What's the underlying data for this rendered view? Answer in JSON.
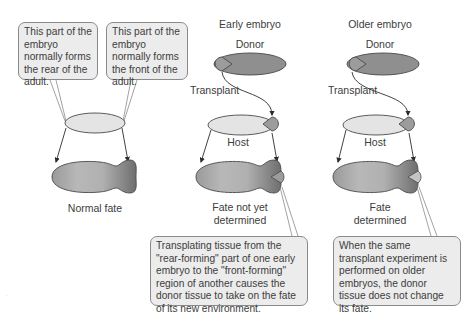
{
  "callouts": {
    "rear": "This part of the embryo normally forms the rear of the adult.",
    "front": "This part of the embryo normally forms the front of the adult.",
    "early_result": "Transplating tissue from the \"rear-forming\" part of one early embryo to the \"front-forming\" region of another causes the donor tissue to take on the fate of its new environment.",
    "older_result": "When the same transplant experiment is performed on older embryos, the donor tissue does not change its fate."
  },
  "columns": {
    "normal": {
      "result_label": "Normal fate"
    },
    "early": {
      "title": "Early embryo",
      "donor_label": "Donor",
      "transplant_label": "Transplant",
      "host_label": "Host",
      "result_label_line1": "Fate not yet",
      "result_label_line2": "determined"
    },
    "older": {
      "title": "Older embryo",
      "donor_label": "Donor",
      "transplant_label": "Transplant",
      "host_label": "Host",
      "result_label_line1": "Fate",
      "result_label_line2": "determined"
    }
  },
  "colors": {
    "callout_fill": "#ececec",
    "donor_fill": "#8f8f8f",
    "host_fill": "#e4e4e4",
    "adult_light": "#cfcfcf",
    "adult_dark": "#7c7c7c",
    "outline": "#4a4a4a"
  }
}
